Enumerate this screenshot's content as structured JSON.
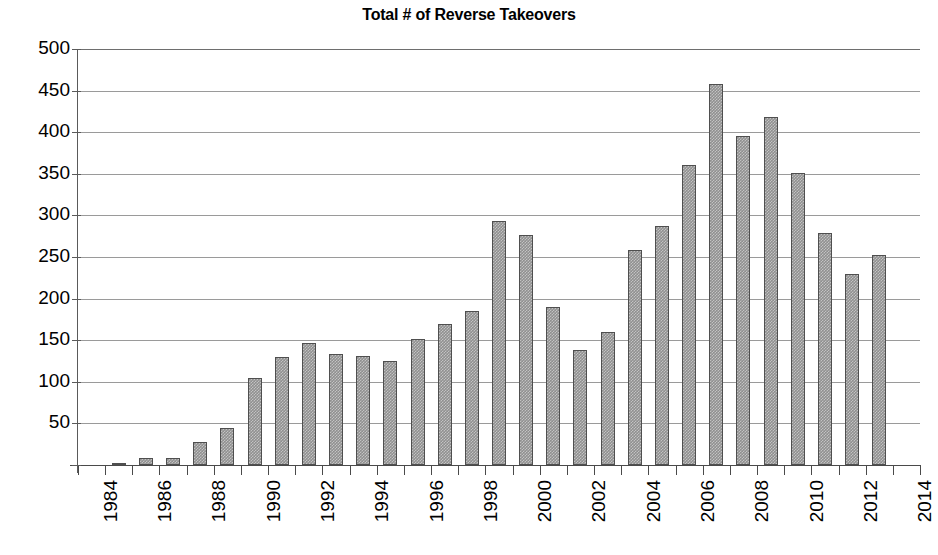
{
  "chart_data": {
    "type": "bar",
    "title": "Total # of Reverse Takeovers",
    "xlabel": "",
    "ylabel": "",
    "ylim": [
      0,
      500
    ],
    "ytick_step": 50,
    "grid": true,
    "legend": "none",
    "xtick_label_rotation": 90,
    "xtick_label_interval": 2,
    "categories": [
      "1984",
      "1985",
      "1986",
      "1987",
      "1988",
      "1989",
      "1990",
      "1991",
      "1992",
      "1993",
      "1994",
      "1995",
      "1996",
      "1997",
      "1998",
      "1999",
      "2000",
      "2001",
      "2002",
      "2003",
      "2004",
      "2005",
      "2006",
      "2007",
      "2008",
      "2009",
      "2010",
      "2011",
      "2012",
      "2013",
      "2014"
    ],
    "values": [
      0,
      2,
      9,
      9,
      28,
      44,
      105,
      130,
      147,
      134,
      131,
      125,
      152,
      170,
      185,
      293,
      276,
      190,
      138,
      160,
      258,
      287,
      360,
      458,
      396,
      418,
      351,
      279,
      230,
      252,
      0
    ],
    "ytick_labels": [
      "500",
      "450",
      "400",
      "350",
      "300",
      "250",
      "200",
      "150",
      "100",
      "50"
    ],
    "ytick_values": [
      500,
      450,
      400,
      350,
      300,
      250,
      200,
      150,
      100,
      50
    ],
    "visible_xtick_labels": [
      "1984",
      "1986",
      "1988",
      "1990",
      "1992",
      "1994",
      "1996",
      "1998",
      "2000",
      "2002",
      "2004",
      "2006",
      "2008",
      "2010",
      "2012",
      "2014"
    ],
    "series_color": "#909090",
    "series_border_color": "#4f4f4f",
    "gridline_color": "#9a9a9a",
    "axis_color": "#4a4a4a",
    "background_color": "#ffffff"
  }
}
